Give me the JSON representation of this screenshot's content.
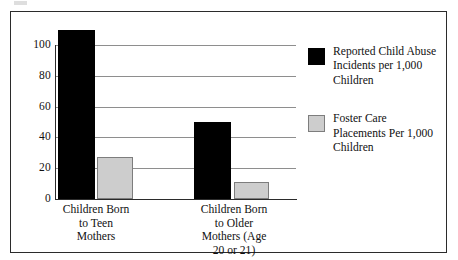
{
  "chart_data": {
    "type": "bar",
    "title": "",
    "subtitle": "",
    "xlabel": "",
    "ylabel": "",
    "ylim": [
      0,
      110
    ],
    "yticks": [
      0,
      20,
      40,
      60,
      80,
      100
    ],
    "ytick_labels": [
      "0",
      "20",
      "40",
      "60",
      "80",
      "100"
    ],
    "grid": true,
    "grid_axis": "y",
    "legend_position": "right",
    "categories": [
      "Children Born\nto Teen\nMothers",
      "Children Born\nto Older\nMothers (Age\n20 or 21)"
    ],
    "series": [
      {
        "name": "Reported Child Abuse\nIncidents per 1,000\nChildren",
        "color": "#000000",
        "values": [
          110,
          50
        ]
      },
      {
        "name": "Foster Care\nPlacements Per 1,000\nChildren",
        "color": "#cdcdcd",
        "values": [
          27,
          11
        ]
      }
    ]
  },
  "axis": {
    "y_ticks": [
      {
        "value": 100,
        "label": "100"
      },
      {
        "value": 80,
        "label": "80"
      },
      {
        "value": 60,
        "label": "60"
      },
      {
        "value": 40,
        "label": "40"
      },
      {
        "value": 20,
        "label": "20"
      },
      {
        "value": 0,
        "label": "0"
      }
    ]
  },
  "categories": {
    "items": [
      {
        "label": "Children Born\nto Teen\nMothers"
      },
      {
        "label": "Children Born\nto Older\nMothers (Age\n20 or 21)"
      }
    ]
  },
  "legend": {
    "entries": [
      {
        "label": "Reported Child Abuse\nIncidents per 1,000\nChildren",
        "swatch": "dark-square-swatch",
        "color": "#000000"
      },
      {
        "label": "Foster Care\nPlacements Per 1,000\nChildren",
        "swatch": "light-square-swatch",
        "color": "#cdcdcd"
      }
    ]
  }
}
